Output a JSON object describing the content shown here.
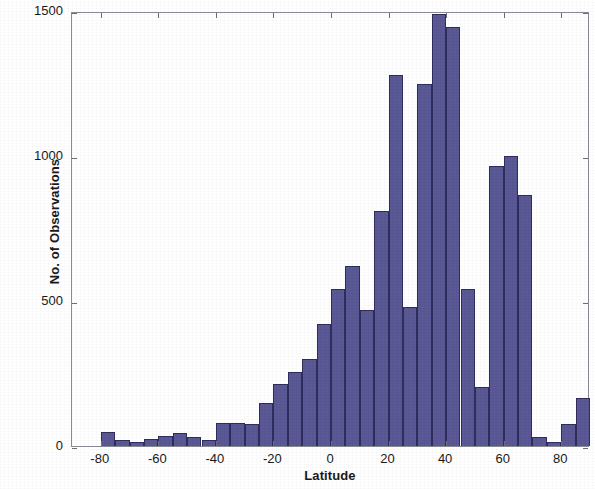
{
  "chart_data": {
    "type": "bar",
    "title": "",
    "subtitle": "",
    "xlabel": "Latitude",
    "ylabel": "No. of Observations",
    "xlim": [
      -90,
      90
    ],
    "ylim": [
      0,
      1500
    ],
    "xticks": [
      -80,
      -60,
      -40,
      -20,
      0,
      20,
      40,
      60,
      80
    ],
    "xticklabels": [
      "-80",
      "-60",
      "-40",
      "-20",
      "0",
      "20",
      "40",
      "60",
      "80"
    ],
    "yticks": [
      0,
      500,
      1000,
      1500
    ],
    "yticklabels": [
      "0",
      "500",
      "1000",
      "1500"
    ],
    "grid": false,
    "legend": null,
    "bin_width": 5,
    "bar_color": "#5a5895",
    "bar_edge_color": "#2f2d5c",
    "axis_color": "#8a8a94",
    "background_color": "#ffffff",
    "categories": [
      "-90 to -85",
      "-85 to -80",
      "-80 to -75",
      "-75 to -70",
      "-70 to -65",
      "-65 to -60",
      "-60 to -55",
      "-55 to -50",
      "-50 to -45",
      "-45 to -40",
      "-40 to -35",
      "-35 to -30",
      "-30 to -25",
      "-25 to -20",
      "-20 to -15",
      "-15 to -10",
      "-10 to -5",
      "-5 to 0",
      "0 to 5",
      "5 to 10",
      "10 to 15",
      "15 to 20",
      "20 to 25",
      "25 to 30",
      "30 to 35",
      "35 to 40",
      "40 to 45",
      "45 to 50",
      "50 to 55",
      "55 to 60",
      "60 to 65",
      "65 to 70",
      "70 to 75",
      "75 to 80",
      "80 to 85",
      "85 to 90"
    ],
    "bin_starts": [
      -90,
      -85,
      -80,
      -75,
      -70,
      -65,
      -60,
      -55,
      -50,
      -45,
      -40,
      -35,
      -30,
      -25,
      -20,
      -15,
      -10,
      -5,
      0,
      5,
      10,
      15,
      20,
      25,
      30,
      35,
      40,
      45,
      50,
      55,
      60,
      65,
      70,
      75,
      80,
      85
    ],
    "values": [
      0,
      0,
      50,
      20,
      15,
      25,
      35,
      45,
      30,
      20,
      80,
      80,
      75,
      150,
      215,
      255,
      300,
      420,
      540,
      620,
      470,
      810,
      1280,
      480,
      1250,
      1490,
      1445,
      540,
      205,
      965,
      1000,
      865,
      30,
      15,
      75,
      165
    ]
  }
}
